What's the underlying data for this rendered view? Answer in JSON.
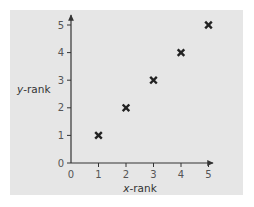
{
  "chart_data": {
    "type": "scatter",
    "title": "",
    "xlabel": "x-rank",
    "ylabel": "y-rank",
    "xlim": [
      0,
      5
    ],
    "ylim": [
      0,
      5
    ],
    "x_ticks": [
      0,
      1,
      2,
      3,
      4,
      5
    ],
    "y_ticks": [
      0,
      1,
      2,
      3,
      4,
      5
    ],
    "grid": false,
    "legend": null,
    "marker": "x",
    "series": [
      {
        "name": "ranks",
        "x": [
          1,
          2,
          3,
          4,
          5
        ],
        "y": [
          1,
          2,
          3,
          4,
          5
        ]
      }
    ]
  },
  "labels": {
    "x_axis_var": "x",
    "x_axis_suffix": "-rank",
    "y_axis_var": "y",
    "y_axis_suffix": "-rank"
  },
  "colors": {
    "panel": "#e6e6e6",
    "axis": "#333333",
    "marker": "#222222",
    "tick_label": "#555555"
  }
}
